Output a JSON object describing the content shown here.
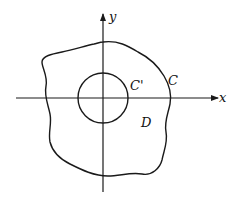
{
  "diagram": {
    "axes": {
      "x_label": "x",
      "y_label": "y",
      "origin": [
        103,
        98
      ]
    },
    "curves": {
      "outer": {
        "label": "C",
        "description": "closed wavy curve enclosing origin"
      },
      "inner": {
        "label": "C'",
        "description": "circle centered at origin",
        "radius_px": 25
      }
    },
    "region": {
      "label": "D",
      "description": "region between C and C'"
    },
    "colors": {
      "stroke": "#1a1a1a",
      "background": "#ffffff"
    }
  }
}
